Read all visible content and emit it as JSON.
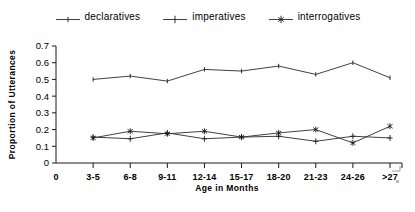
{
  "legend": {
    "entries": [
      {
        "label": "declaratives",
        "marker": "dash-tick-marker"
      },
      {
        "label": "imperatives",
        "marker": "plus-marker"
      },
      {
        "label": "interrogatives",
        "marker": "asterisk-marker"
      }
    ]
  },
  "chart_data": {
    "type": "line",
    "title": "",
    "xlabel": "Age in Months",
    "ylabel": "Proportion of Utterances",
    "categories": [
      "3-5",
      "6-8",
      "9-11",
      "12-14",
      "15-17",
      "18-20",
      "21-23",
      "24-26",
      ">27"
    ],
    "x_tick_labels": [
      "0",
      "3-5",
      "6-8",
      "9-11",
      "12-14",
      "15-17",
      "18-20",
      "21-23",
      "24-26",
      ">27"
    ],
    "y_tick_labels": [
      "0",
      "0.1",
      "0.2",
      "0.3",
      "0.4",
      "0.5",
      "0.6",
      "0.7"
    ],
    "y_tick_values": [
      0,
      0.1,
      0.2,
      0.3,
      0.4,
      0.5,
      0.6,
      0.7
    ],
    "ylim": [
      0,
      0.7
    ],
    "grid": false,
    "legend_position": "top-center",
    "series": [
      {
        "name": "declaratives",
        "marker": "dash-tick-marker",
        "values": [
          0.5,
          0.52,
          0.49,
          0.56,
          0.55,
          0.58,
          0.53,
          0.6,
          0.51
        ]
      },
      {
        "name": "imperatives",
        "marker": "plus-marker",
        "values": [
          0.155,
          0.145,
          0.18,
          0.145,
          0.155,
          0.16,
          0.13,
          0.16,
          0.15
        ]
      },
      {
        "name": "interrogatives",
        "marker": "asterisk-marker",
        "values": [
          0.15,
          0.19,
          0.175,
          0.19,
          0.155,
          0.18,
          0.2,
          0.12,
          0.22
        ]
      }
    ]
  },
  "colors": {
    "line": "#2b2b2b",
    "axis": "#1a1a1a",
    "background": "#ffffff"
  }
}
